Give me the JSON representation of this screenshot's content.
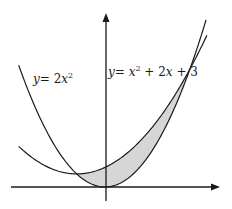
{
  "figure": {
    "background": "#ffffff",
    "stroke_color": "#1a1a1a",
    "shade_color": "#d6d6d6",
    "axes": {
      "origin_px": [
        105,
        187
      ],
      "x_axis": {
        "from_px": 11,
        "to_px": 219,
        "arrow": true
      },
      "y_axis": {
        "from_px": 201,
        "to_px": 13,
        "arrow": true
      },
      "scale_px_per_unit": {
        "x": 28.3,
        "y": 6.55
      }
    },
    "curves": [
      {
        "id": "parabola-a",
        "label_var": "y",
        "label_eq": "= 2",
        "label_x": "x",
        "label_sup": "2",
        "expression": "y = 2x^2",
        "x_range": [
          -3.05,
          3.6
        ]
      },
      {
        "id": "parabola-b",
        "label_var": "y",
        "label_eq": "= ",
        "label_x": "x",
        "label_sup": "2",
        "label_rest": " + 2",
        "label_x2": "x",
        "label_tail": " + 3",
        "expression": "y = x^2 + 2x + 3",
        "x_range": [
          -3.05,
          3.6
        ]
      }
    ],
    "shaded_region": {
      "between": [
        "y = x^2 + 2x + 3",
        "y = 2x^2"
      ],
      "x_from": -1,
      "x_to": 3
    },
    "intersections": [
      [
        -1,
        2
      ],
      [
        3,
        18
      ]
    ]
  },
  "chart_data": {
    "type": "line",
    "title": "",
    "xlabel": "",
    "ylabel": "",
    "series": [
      {
        "name": "y = 2x^2",
        "x": [
          -3,
          -2,
          -1,
          0,
          1,
          2,
          3,
          3.5
        ],
        "values": [
          18,
          8,
          2,
          0,
          2,
          8,
          18,
          24.5
        ]
      },
      {
        "name": "y = x^2 + 2x + 3",
        "x": [
          -3,
          -2,
          -1,
          0,
          1,
          2,
          3,
          3.5
        ],
        "values": [
          6,
          3,
          2,
          3,
          6,
          11,
          18,
          22.25
        ]
      }
    ],
    "annotations": [
      "y = 2x^2",
      "y = x^2 + 2x + 3",
      "shaded area between curves from x = -1 to x = 3"
    ],
    "grid": false
  }
}
